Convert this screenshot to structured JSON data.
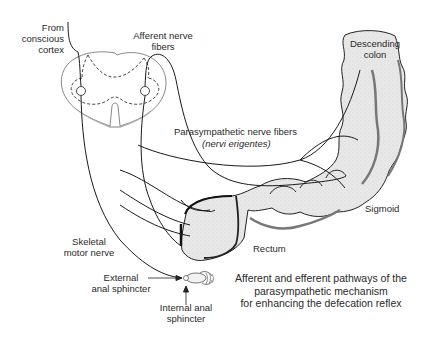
{
  "diagram": {
    "title": "Afferent and efferent pathways of the parasympathetic mechanism for enhancing the defecation reflex",
    "caption_lines": [
      "Afferent and efferent pathways of the",
      "parasympathetic mechanism",
      "for enhancing the defecation reflex"
    ],
    "labels": {
      "from_cortex": [
        "From",
        "conscious",
        "cortex"
      ],
      "afferent": [
        "Afferent nerve",
        "fibers"
      ],
      "descending_colon": [
        "Descending",
        "colon"
      ],
      "parasympathetic": "Parasympathetic nerve fibers",
      "nervi_erigentes": "(nervi erigentes)",
      "sigmoid": "Sigmoid",
      "rectum": "Rectum",
      "skeletal_motor": [
        "Skeletal",
        "motor nerve"
      ],
      "external_sphincter": [
        "External",
        "anal sphincter"
      ],
      "internal_sphincter": [
        "Internal anal",
        "sphincter"
      ]
    },
    "colors": {
      "line": "#222222",
      "colon_fill": "#e6e6e6",
      "colon_shadow": "#8a8a8a",
      "background": "#ffffff"
    }
  }
}
